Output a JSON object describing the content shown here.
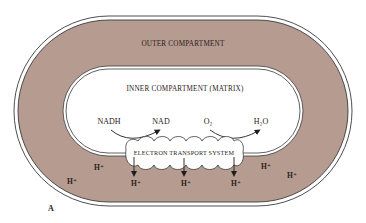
{
  "diagram": {
    "panel_label": "A",
    "colors": {
      "outer_compartment_fill": "#b69b90",
      "membrane_line": "#3a3a3a",
      "matrix_fill": "#ffffff",
      "text": "#2a201c"
    },
    "outer_compartment": {
      "label": "OUTER COMPARTMENT"
    },
    "inner_compartment": {
      "label": "INNER COMPARTMENT (MATRIX)"
    },
    "reactions": [
      {
        "from": "NADH",
        "to": "NAD"
      },
      {
        "from": "O₂",
        "to": "H₂O"
      }
    ],
    "electron_transport_system": {
      "label": "ELECTRON TRANSPORT SYSTEM",
      "proton_outputs": [
        "H⁺",
        "H⁺",
        "H⁺"
      ]
    },
    "protons_in_outer_compartment": [
      "H⁺",
      "H⁺",
      "H⁺",
      "H⁺"
    ]
  }
}
